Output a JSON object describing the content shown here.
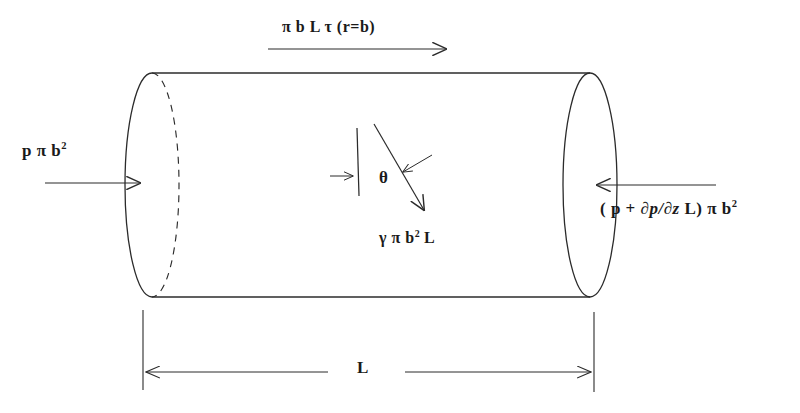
{
  "diagram": {
    "stroke_color": "#2b2b2b",
    "text_color": "#1a1a1a",
    "background_color": "#ffffff",
    "labels": {
      "top_force": "π b L τ (r=b)",
      "left_force_main": "p π b",
      "left_force_exponent": "2",
      "right_force_main_prefix": "( p + ",
      "right_force_derivative": "∂p/∂z",
      "right_force_main_suffix": " L) π b",
      "right_force_exponent": "2",
      "theta": "θ",
      "weight_main": "γ π b",
      "weight_exponent": "2",
      "weight_suffix": " L",
      "length": "L"
    },
    "annotations": {
      "top_force_description": "shear force on cylinder surface",
      "left_force_description": "pressure force on upstream face",
      "right_force_description": "pressure force on downstream face",
      "theta_description": "angle of inclination from vertical",
      "weight_description": "weight of fluid element",
      "length_description": "cylinder length dimension"
    },
    "geometry": {
      "cylinder_left_center_x": 152,
      "cylinder_right_center_x": 590,
      "cylinder_center_y": 185,
      "ellipse_rx": 27,
      "ellipse_ry": 112,
      "top_line_y": 73,
      "bottom_line_y": 297,
      "dimension_line_y": 372,
      "dimension_left_x": 143,
      "dimension_right_x": 594
    }
  }
}
